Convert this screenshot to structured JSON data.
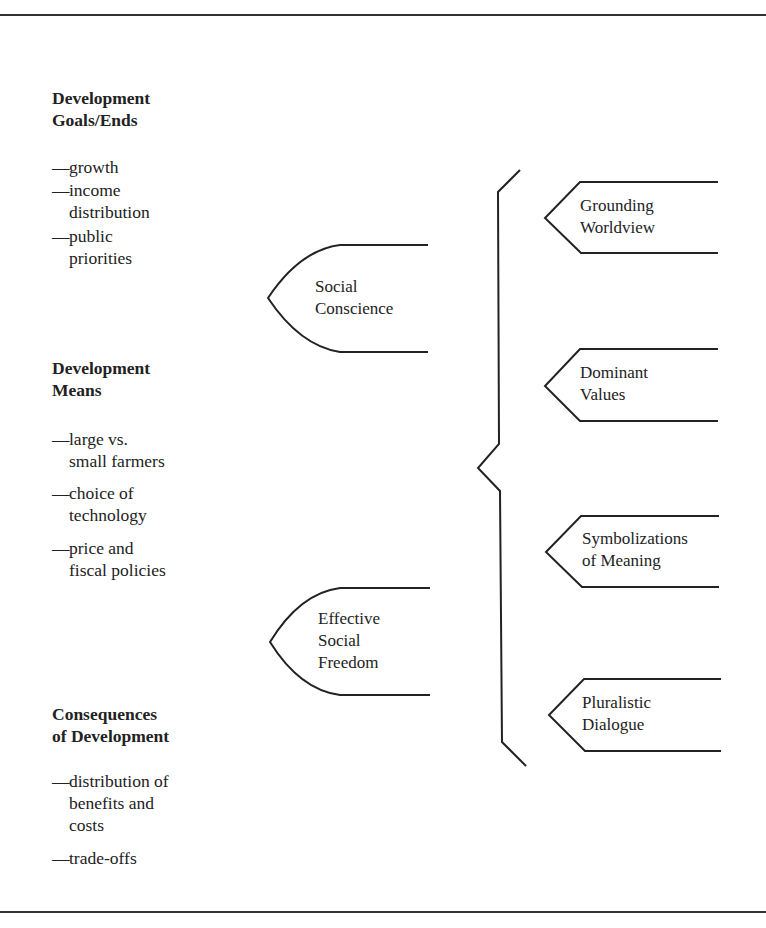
{
  "left_column": {
    "groups": [
      {
        "heading": [
          "Development",
          "Goals/Ends"
        ],
        "items": [
          {
            "dash": "—",
            "lines": [
              "growth"
            ]
          },
          {
            "dash": "—",
            "lines": [
              "income",
              "distribution"
            ]
          },
          {
            "dash": "—",
            "lines": [
              "public",
              "priorities"
            ]
          }
        ]
      },
      {
        "heading": [
          "Development",
          "Means"
        ],
        "items": [
          {
            "dash": "—",
            "lines": [
              "large vs.",
              "small farmers"
            ]
          },
          {
            "dash": "—",
            "lines": [
              "choice of",
              "technology"
            ]
          },
          {
            "dash": "—",
            "lines": [
              "price and",
              "fiscal policies"
            ]
          }
        ]
      },
      {
        "heading": [
          "Consequences",
          "of Development"
        ],
        "items": [
          {
            "dash": "—",
            "lines": [
              "distribution of",
              "benefits and",
              "costs"
            ]
          },
          {
            "dash": "—",
            "lines": [
              "trade-offs"
            ]
          }
        ]
      }
    ]
  },
  "middle_column": {
    "shapes": [
      {
        "lines": [
          "Social",
          "Conscience"
        ]
      },
      {
        "lines": [
          "Effective",
          "Social",
          "Freedom"
        ]
      }
    ]
  },
  "right_column": {
    "arrows": [
      {
        "lines": [
          "Grounding",
          "Worldview"
        ]
      },
      {
        "lines": [
          "Dominant",
          "Values"
        ]
      },
      {
        "lines": [
          "Symbolizations",
          "of Meaning"
        ]
      },
      {
        "lines": [
          "Pluralistic",
          "Dialogue"
        ]
      }
    ]
  },
  "colors": {
    "ink": "#222222",
    "background": "#ffffff"
  }
}
